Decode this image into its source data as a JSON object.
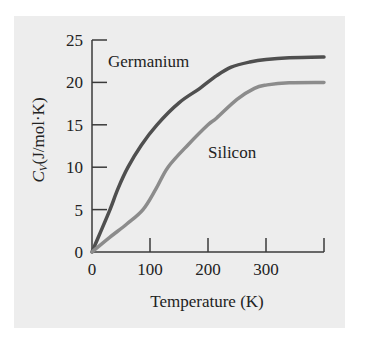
{
  "chart_data": {
    "type": "line",
    "title": "",
    "xlabel": "Temperature (K)",
    "ylabel": "C_V (J/mol·K)",
    "ylabel_main": "C",
    "ylabel_sub": "V",
    "ylabel_rest": "(J/mol·K)",
    "xlim": [
      0,
      400
    ],
    "ylim": [
      0,
      25
    ],
    "xticks": [
      0,
      100,
      200,
      300,
      400
    ],
    "xtick_labels": [
      "0",
      "100",
      "200",
      "300",
      ""
    ],
    "yticks": [
      0,
      5,
      10,
      15,
      20,
      25
    ],
    "ytick_labels": [
      "0",
      "5",
      "10",
      "15",
      "20",
      "25"
    ],
    "grid": false,
    "legend": "inline labels",
    "series": [
      {
        "name": "Germanium",
        "color": "#4f4f4f",
        "x": [
          0,
          15,
          31,
          45,
          62,
          85,
          112,
          150,
          186,
          215,
          240,
          272,
          300,
          340,
          400
        ],
        "y": [
          0,
          2.4,
          5,
          7.5,
          10,
          12.6,
          15,
          17.6,
          19.3,
          20.8,
          21.8,
          22.4,
          22.7,
          22.9,
          23.0
        ]
      },
      {
        "name": "Silicon",
        "color": "#8c8c8c",
        "x": [
          0,
          30,
          60,
          88,
          110,
          131,
          165,
          200,
          215,
          250,
          280,
          302,
          340,
          400
        ],
        "y": [
          0,
          1.7,
          3.3,
          5,
          7.4,
          10,
          12.6,
          15,
          15.8,
          18.0,
          19.3,
          19.7,
          19.95,
          20.0
        ]
      }
    ],
    "annotations": [
      {
        "text": "Germanium",
        "x": 108,
        "y": 67
      },
      {
        "text": "Silicon",
        "x": 208,
        "y": 158
      }
    ]
  }
}
